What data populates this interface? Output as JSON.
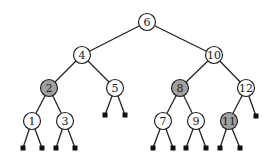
{
  "diagram": {
    "type": "binary-search-tree",
    "colors": {
      "white_node": "#ffffff",
      "grey_node": "#a0a0a0",
      "stroke": "#222222",
      "leaf": "#111111"
    },
    "nodes": [
      {
        "id": "n6",
        "label": "6",
        "x": 147,
        "y": 22,
        "shaded": false
      },
      {
        "id": "n4",
        "label": "4",
        "x": 82,
        "y": 55,
        "shaded": false
      },
      {
        "id": "n10",
        "label": "10",
        "x": 214,
        "y": 55,
        "shaded": false
      },
      {
        "id": "n2",
        "label": "2",
        "x": 49,
        "y": 88,
        "shaded": true
      },
      {
        "id": "n5",
        "label": "5",
        "x": 115,
        "y": 88,
        "shaded": false
      },
      {
        "id": "n8",
        "label": "8",
        "x": 180,
        "y": 88,
        "shaded": true
      },
      {
        "id": "n12",
        "label": "12",
        "x": 246,
        "y": 88,
        "shaded": false
      },
      {
        "id": "n1",
        "label": "1",
        "x": 32,
        "y": 121,
        "shaded": false
      },
      {
        "id": "n3",
        "label": "3",
        "x": 65,
        "y": 121,
        "shaded": false
      },
      {
        "id": "n7",
        "label": "7",
        "x": 163,
        "y": 121,
        "shaded": false
      },
      {
        "id": "n9",
        "label": "9",
        "x": 196,
        "y": 121,
        "shaded": false
      },
      {
        "id": "n11",
        "label": "11",
        "x": 229,
        "y": 121,
        "shaded": true
      }
    ],
    "edges": [
      [
        "n6",
        "n4"
      ],
      [
        "n6",
        "n10"
      ],
      [
        "n4",
        "n2"
      ],
      [
        "n4",
        "n5"
      ],
      [
        "n10",
        "n8"
      ],
      [
        "n10",
        "n12"
      ],
      [
        "n2",
        "n1"
      ],
      [
        "n2",
        "n3"
      ],
      [
        "n8",
        "n7"
      ],
      [
        "n8",
        "n9"
      ],
      [
        "n12",
        "n11"
      ]
    ],
    "leaves": [
      {
        "parent": "n1",
        "x": 23,
        "y": 148
      },
      {
        "parent": "n1",
        "x": 42,
        "y": 148
      },
      {
        "parent": "n3",
        "x": 56,
        "y": 148
      },
      {
        "parent": "n3",
        "x": 75,
        "y": 148
      },
      {
        "parent": "n5",
        "x": 105,
        "y": 115
      },
      {
        "parent": "n5",
        "x": 125,
        "y": 115
      },
      {
        "parent": "n7",
        "x": 153,
        "y": 148
      },
      {
        "parent": "n7",
        "x": 173,
        "y": 148
      },
      {
        "parent": "n9",
        "x": 186,
        "y": 148
      },
      {
        "parent": "n9",
        "x": 206,
        "y": 148
      },
      {
        "parent": "n11",
        "x": 220,
        "y": 148
      },
      {
        "parent": "n11",
        "x": 240,
        "y": 148
      },
      {
        "parent": "n12",
        "x": 256,
        "y": 116
      }
    ]
  }
}
